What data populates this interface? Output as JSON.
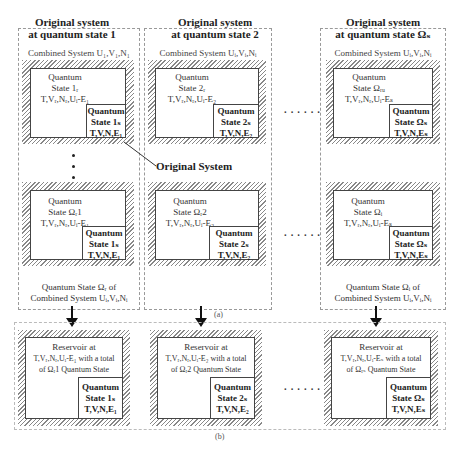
{
  "part_a": {
    "columns": [
      {
        "title_line1": "Original system",
        "title_line2": "at quantum state 1",
        "combined_label": "Combined System U₁,V₁,N₁",
        "top_block": {
          "q1": "Quantum",
          "q2": "State 1ᵣ",
          "q3": "T,Vᵣ,Nᵣ,Uᵢ-E₁",
          "s1": "Quantum",
          "s2": "State 1ₛ",
          "s3": "T,V,N,E₁"
        },
        "bottom_block": {
          "q1": "Quantum",
          "q2": "State Ωᵣ1",
          "q3": "T,Vᵣ,Nᵣ,Uᵢ-E₁",
          "s1": "Quantum",
          "s2": "State 1ₛ",
          "s3": "T,V,N,E₁"
        },
        "footer_line1": "Quantum State Ωᵣ of",
        "footer_line2": "Combined System Uᵢ,Vᵢ,Nᵢ"
      },
      {
        "title_line1": "Original system",
        "title_line2": "at quantum state 2",
        "combined_label": "Combined System Uᵢ,Vᵢ,Nᵢ",
        "top_block": {
          "q1": "Quantum",
          "q2": "State 2ᵣ",
          "q3": "T,Vᵣ,Nᵣ,Uᵢ-E₂",
          "s1": "Quantum",
          "s2": "State 2ₛ",
          "s3": "T,V,N,E₂"
        },
        "bottom_block": {
          "q1": "Quantum",
          "q2": "State Ωᵣ2",
          "q3": "T,Vᵣ,Nᵣ,Uᵢ-E₂",
          "s1": "Quantum",
          "s2": "State 2ₛ",
          "s3": "T,V,N,E₂"
        }
      },
      {
        "title_line1": "Original system",
        "title_line2": "at quantum state Ωₛ",
        "combined_label": "Combined System Uᵢ,Vᵢ,Nᵢ",
        "top_block": {
          "q1": "Quantum",
          "q2": "State Ωᵣᵤ",
          "q3": "T,Vᵣ,Nᵣ,Uᵢ-Eₛ",
          "s1": "Quantum",
          "s2": "State Ωₛ",
          "s3": "T,V,N,Eₛ"
        },
        "bottom_block": {
          "q1": "Quantum",
          "q2": "State Ωᵢ",
          "q3": "T,Vᵣ,Nᵣ,Uᵢ-Eₛ",
          "s1": "Quantum",
          "s2": "State Ωₛ",
          "s3": "T,V,N,Eₛ"
        },
        "footer_line1": "Quantum State Ωᵢ of",
        "footer_line2": "Combined System Uᵢ,Vᵢ,Nᵢ"
      }
    ],
    "callout": "Original System",
    "ellipsis": "······",
    "label": "(a)"
  },
  "part_b": {
    "reservoirs": [
      {
        "r1": "Reservoir at",
        "r2": "T,Vᵣ,Nᵣ,Uᵢ-E₁ with a total",
        "r3": "of Ωᵣ1 Quantum State",
        "s1": "Quantum",
        "s2": "State 1ₛ",
        "s3": "T,V,N,E₁"
      },
      {
        "r1": "Reservoir at",
        "r2": "T,Vᵣ,Nᵣ,Uᵢ-E₂ with a total",
        "r3": "of Ωᵣ2 Quantum State",
        "s1": "Quantum",
        "s2": "State 2ₛ",
        "s3": "T,V,N,E₂"
      },
      {
        "r1": "Reservoir at",
        "r2": "T,Vᵣ,Nᵣ,Uᵢ-Eₛ with a total",
        "r3": "of Ωᵣₛ Quantum State",
        "s1": "Quantum",
        "s2": "State Ωₛ",
        "s3": "T,V,N,Eₛ"
      }
    ],
    "ellipsis": "······",
    "label": "(b)"
  }
}
